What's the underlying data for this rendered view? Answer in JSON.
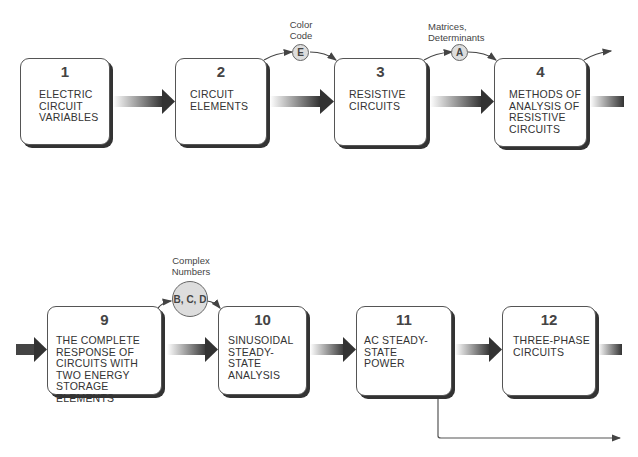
{
  "diagram": {
    "type": "flowchart",
    "colors": {
      "box_border": "#555555",
      "box_shadow": "#333333",
      "arrow_dark": "#333333",
      "circle_fill": "#dddddd"
    },
    "top_row": [
      {
        "number": "1",
        "label": "ELECTRIC\nCIRCUIT\nVARIABLES"
      },
      {
        "number": "2",
        "label": "CIRCUIT\nELEMENTS"
      },
      {
        "number": "3",
        "label": "RESISTIVE\nCIRCUITS"
      },
      {
        "number": "4",
        "label": "METHODS OF\nANALYSIS OF\nRESISTIVE\nCIRCUITS"
      }
    ],
    "bottom_row": [
      {
        "number": "9",
        "label": "THE COMPLETE\nRESPONSE OF\nCIRCUITS WITH\nTWO ENERGY\nSTORAGE ELEMENTS"
      },
      {
        "number": "10",
        "label": "SINUSOIDAL\nSTEADY-STATE\nANALYSIS"
      },
      {
        "number": "11",
        "label": "AC STEADY-STATE\nPOWER"
      },
      {
        "number": "12",
        "label": "THREE-PHASE\nCIRCUITS"
      }
    ],
    "appendices": [
      {
        "letter": "E",
        "note": "Color\nCode"
      },
      {
        "letter": "A",
        "note": "Matrices,\nDeterminants"
      },
      {
        "letter": "B, C, D",
        "note": "Complex\nNumbers"
      }
    ]
  }
}
